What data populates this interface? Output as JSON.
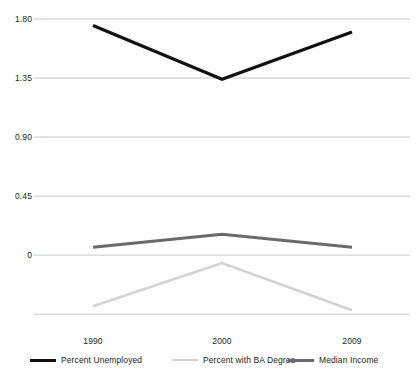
{
  "chart_data": {
    "type": "line",
    "title": "",
    "subtitle": "",
    "xlabel": "",
    "ylabel": "",
    "x": [
      "1990",
      "2000",
      "2009"
    ],
    "categories": [
      "1990",
      "2000",
      "2009"
    ],
    "series": [
      {
        "name": "Percent Unemployed",
        "color": "#111111",
        "width": 3.2,
        "values": [
          1.75,
          1.34,
          1.7
        ]
      },
      {
        "name": "Percent with BA Degree",
        "color": "#d2d2d2",
        "width": 2.6,
        "values": [
          -0.39,
          -0.06,
          -0.42
        ]
      },
      {
        "name": "Median Income",
        "color": "#6a6a6a",
        "width": 3.0,
        "values": [
          0.06,
          0.16,
          0.06
        ]
      }
    ],
    "ylim": [
      -0.54,
      1.8
    ],
    "xlim": [
      0,
      2
    ],
    "yticks": [
      1.8,
      1.35,
      0.9,
      0.45,
      0
    ],
    "ytick_labels": [
      "1.80",
      "1.35",
      "0.90",
      "0.45",
      "0"
    ],
    "gridlines": [
      1.8,
      1.35,
      0.9,
      0.45,
      0,
      -0.45
    ],
    "grid": true,
    "grid_color": "#bfbfbf",
    "legend_position": "bottom",
    "background": "#ffffff"
  },
  "axes": {
    "y_ticks": [
      {
        "label": "1.80",
        "value": 1.8
      },
      {
        "label": "1.35",
        "value": 1.35
      },
      {
        "label": "0.90",
        "value": 0.9
      },
      {
        "label": "0.45",
        "value": 0.45
      },
      {
        "label": "0",
        "value": 0
      }
    ],
    "x_ticks": [
      {
        "label": "1990"
      },
      {
        "label": "2000"
      },
      {
        "label": "2009"
      }
    ]
  },
  "legend": {
    "items": [
      {
        "label": "Percent Unemployed",
        "color": "#111111"
      },
      {
        "label": "Percent with BA Degree",
        "color": "#d2d2d2"
      },
      {
        "label": "Median Income",
        "color": "#6a6a6a"
      }
    ]
  }
}
